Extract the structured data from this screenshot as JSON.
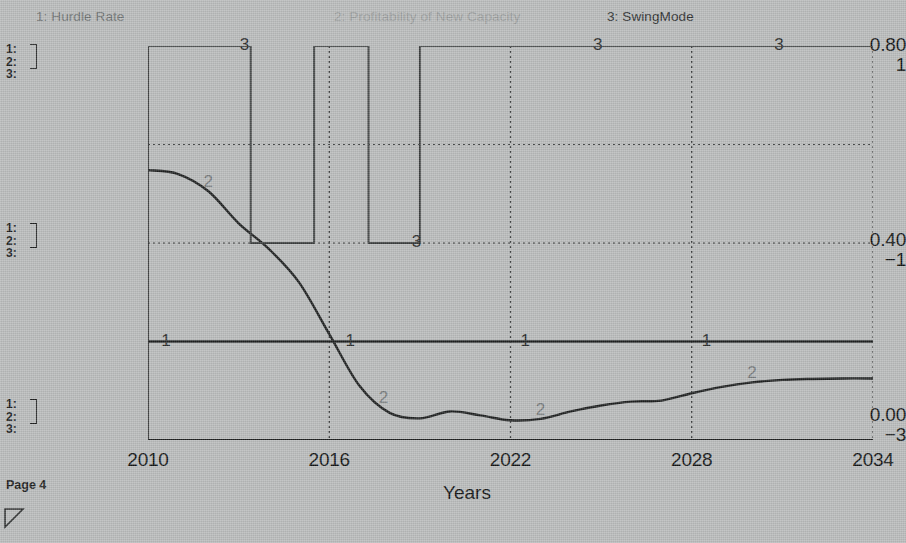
{
  "legend": [
    {
      "key": "1",
      "label": "1: Hurdle Rate",
      "color": "#6e7272"
    },
    {
      "key": "2",
      "label": "2: Profitability of New Capacity",
      "color": "#9a9d9d"
    },
    {
      "key": "3",
      "label": "3: SwingMode",
      "color": "#2b2d2d"
    }
  ],
  "axis_groups": {
    "top": {
      "r1": "1:",
      "r2": "2:",
      "r3": "3:"
    },
    "mid": {
      "r1": "1:",
      "r2": "2:",
      "r3": "3:"
    },
    "bottom": {
      "r1": "1:",
      "r2": "2:",
      "r3": "3:"
    }
  },
  "scales": {
    "top": {
      "primary": "0.80",
      "secondary": "1"
    },
    "mid": {
      "primary": "0.40",
      "secondary": "−1"
    },
    "bottom": {
      "primary": "0.00",
      "secondary": "−3"
    }
  },
  "xticks": [
    "2010",
    "2016",
    "2022",
    "2028",
    "2034"
  ],
  "xaxis_title": "Years",
  "footer": {
    "page_label": "Page 4",
    "resize_handle_icon": "resize-triangle-icon"
  },
  "chart_data": {
    "type": "line",
    "title": "",
    "xlabel": "Years",
    "ylabel": "",
    "grid": true,
    "legend_position": "top",
    "xlim": [
      2010,
      2034
    ],
    "xticks": [
      2010,
      2016,
      2022,
      2028,
      2034
    ],
    "axes": [
      {
        "id": "left-primary",
        "label": "0.00 - 0.80",
        "ticks": [
          "0.00",
          "0.40",
          "0.80"
        ],
        "range": [
          0.0,
          0.8
        ]
      },
      {
        "id": "left-secondary",
        "label": "-3 - 1",
        "ticks": [
          "−3",
          "−1",
          "1"
        ],
        "range": [
          -3,
          1
        ]
      }
    ],
    "series": [
      {
        "name": "Hurdle Rate",
        "key": "1",
        "color": "#1d1f1f",
        "axis": "left-primary",
        "style": "flat",
        "constant_value": 0.2,
        "x": [
          2010,
          2016,
          2022,
          2028,
          2034
        ],
        "values": [
          0.2,
          0.2,
          0.2,
          0.2,
          0.2
        ],
        "label_positions_years": [
          2010.6,
          2016.7,
          2022.5,
          2028.5
        ]
      },
      {
        "name": "Profitability of New Capacity",
        "key": "2",
        "color": "#1d1f1f",
        "axis": "left-primary",
        "style": "smooth",
        "x": [
          2010,
          2011,
          2012,
          2013,
          2014,
          2015,
          2016,
          2017,
          2018,
          2019,
          2020,
          2021,
          2022,
          2023,
          2024,
          2025,
          2026,
          2027,
          2028,
          2029,
          2030,
          2031,
          2032,
          2033,
          2034
        ],
        "values": [
          0.548,
          0.54,
          0.505,
          0.44,
          0.388,
          0.32,
          0.215,
          0.11,
          0.055,
          0.044,
          0.058,
          0.05,
          0.04,
          0.043,
          0.058,
          0.07,
          0.078,
          0.08,
          0.095,
          0.108,
          0.117,
          0.122,
          0.124,
          0.125,
          0.125
        ],
        "label_positions_years": [
          2012.0,
          2017.8,
          2023.0,
          2030.0
        ]
      },
      {
        "name": "SwingMode",
        "key": "3",
        "color": "#3a3d3d",
        "axis": "left-secondary",
        "style": "step",
        "description": "square wave: 1 (on) except two off intervals",
        "x": [
          2010,
          2013.4,
          2013.4,
          2015.5,
          2015.5,
          2017.3,
          2017.3,
          2019.0,
          2019.0,
          2034
        ],
        "values": [
          1,
          1,
          -1,
          -1,
          1,
          1,
          -1,
          -1,
          1,
          1
        ],
        "off_intervals": [
          [
            2013.4,
            2015.5
          ],
          [
            2017.3,
            2019.0
          ]
        ],
        "on_value": 1,
        "off_value": -1,
        "label_positions_years": [
          2013.2,
          2018.9,
          2024.9,
          2030.9
        ]
      }
    ]
  }
}
